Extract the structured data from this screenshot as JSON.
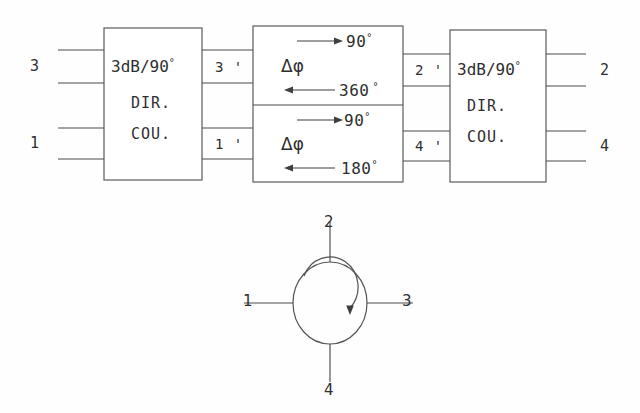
{
  "diagram": {
    "line_color": "#4a4a4a",
    "text_color": "#2e2e2e",
    "background": "#ffffff"
  },
  "coupler_left": {
    "title": "3dB/90",
    "degree": "°",
    "line2": "DIR.",
    "line3": "COU.",
    "input_ports": [
      {
        "label": "3"
      },
      {
        "label": "1"
      }
    ],
    "output_ports": [
      {
        "label": "3 '"
      },
      {
        "label": "1 '"
      }
    ]
  },
  "phase_section": {
    "upper": {
      "forward_value": "90",
      "forward_degree": "°",
      "symbol": "Δφ",
      "reverse_value": "360",
      "reverse_degree": "°"
    },
    "lower": {
      "forward_value": "90",
      "forward_degree": "°",
      "symbol": "Δφ",
      "reverse_value": "180",
      "reverse_degree": "°"
    }
  },
  "coupler_right": {
    "title": "3dB/90",
    "degree": "°",
    "line2": "DIR.",
    "line3": "COU.",
    "input_ports": [
      {
        "label": "2 '"
      },
      {
        "label": "4 '"
      }
    ],
    "output_ports": [
      {
        "label": "2"
      },
      {
        "label": "4"
      }
    ]
  },
  "circulator": {
    "port_left": "1",
    "port_top": "2",
    "port_right": "3",
    "port_bottom": "4",
    "rotation": "clockwise"
  }
}
